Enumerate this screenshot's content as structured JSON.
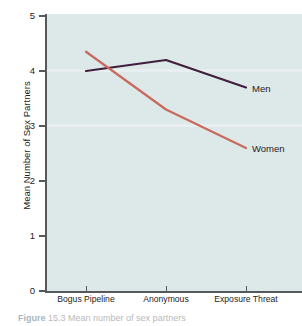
{
  "chart_data": {
    "type": "line",
    "title": "",
    "xlabel": "",
    "ylabel": "Mean Number of Sex Partners",
    "categories": [
      "Bogus Pipeline",
      "Anonymous",
      "Exposure Threat"
    ],
    "series": [
      {
        "name": "Men",
        "values": [
          4.0,
          4.2,
          3.7
        ],
        "color": "#3f1f3c"
      },
      {
        "name": "Women",
        "values": [
          4.35,
          3.3,
          2.6
        ],
        "color": "#c96a5e"
      }
    ],
    "ylim": [
      0,
      5
    ],
    "yticks": [
      "0",
      "1",
      "2",
      "3",
      "4",
      "5"
    ],
    "grid": false,
    "legend_position": "inline-right",
    "annotations": [
      "Men",
      "Women"
    ]
  },
  "axes": {
    "y_title": "Mean Number of Sex Partners",
    "y_tick_labels": [
      "5",
      "4",
      "3",
      "2",
      "1",
      "0"
    ],
    "x_tick_labels": [
      "Bogus Pipeline",
      "Anonymous",
      "Exposure Threat"
    ]
  },
  "labels": {
    "men": "Men",
    "women": "Women"
  },
  "caption": {
    "lead": "Figure",
    "number": "15.3",
    "text": "Mean number of sex partners"
  },
  "colors": {
    "plot_background": "#dde8e9",
    "axis": "#55595b",
    "men_line": "#3f1f3c",
    "women_line": "#c96a5e",
    "text": "#1d1d1d"
  }
}
